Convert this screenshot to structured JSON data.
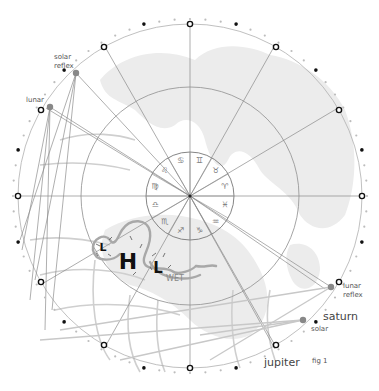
{
  "figure": {
    "caption": "fig 1",
    "colors": {
      "landmass": "#ececec",
      "rings": "#9a9a9a",
      "lines": "#888888",
      "front": "#a8a8a8",
      "dot_dark": "#111111",
      "dot_grey": "#888888"
    },
    "zodiac": [
      {
        "sign": "cancer",
        "glyph": "♋"
      },
      {
        "sign": "gemini",
        "glyph": "♊"
      },
      {
        "sign": "taurus",
        "glyph": "♉"
      },
      {
        "sign": "aries",
        "glyph": "♈"
      },
      {
        "sign": "pisces",
        "glyph": "♓"
      },
      {
        "sign": "aquarius",
        "glyph": "♒"
      },
      {
        "sign": "capricorn",
        "glyph": "♑"
      },
      {
        "sign": "sagittarius",
        "glyph": "♐"
      },
      {
        "sign": "scorpio",
        "glyph": "♏"
      },
      {
        "sign": "libra",
        "glyph": "♎"
      },
      {
        "sign": "virgo",
        "glyph": "♍"
      },
      {
        "sign": "leo",
        "glyph": "♌"
      }
    ],
    "labels": {
      "solar_reflex_1": "solar",
      "solar_reflex_2": "reflex",
      "lunar": "lunar",
      "lunar_reflex_1": "lunar",
      "lunar_reflex_2": "reflex",
      "saturn": "saturn",
      "solar": "solar",
      "jupiter": "jupiter"
    },
    "weather": {
      "high": "H",
      "low_left": "L",
      "low_right": "L",
      "wet": "WET"
    }
  }
}
